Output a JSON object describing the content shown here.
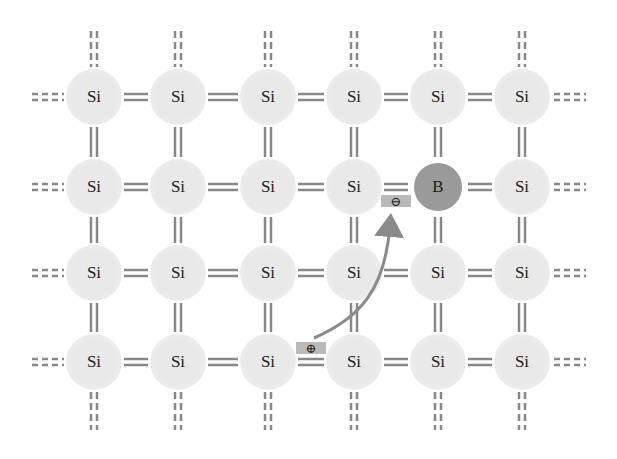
{
  "diagram": {
    "lattice": {
      "columns_x": [
        94,
        178,
        268,
        354,
        438,
        522
      ],
      "rows_y": [
        97,
        187,
        273,
        362
      ],
      "atoms": [
        [
          "Si",
          "Si",
          "Si",
          "Si",
          "Si",
          "Si"
        ],
        [
          "Si",
          "Si",
          "Si",
          "Si",
          "B",
          "Si"
        ],
        [
          "Si",
          "Si",
          "Si",
          "Si",
          "Si",
          "Si"
        ],
        [
          "Si",
          "Si",
          "Si",
          "Si",
          "Si",
          "Si"
        ]
      ]
    },
    "dopant": {
      "label": "B",
      "row": 1,
      "col": 4
    },
    "electron_badge": {
      "symbol": "⊖",
      "x": 396,
      "y": 201
    },
    "hole_badge": {
      "symbol": "⊕",
      "x": 311,
      "y": 348
    },
    "colors": {
      "bond": "#888888",
      "atom_fill": "#e9e9e9",
      "boron_fill": "#9a9a9a",
      "arrow": "#8a8a8a",
      "badge": "#b9b9b9"
    }
  }
}
